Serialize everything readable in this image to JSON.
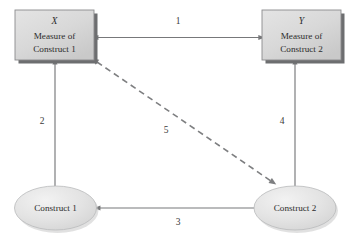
{
  "figure": {
    "type": "nomological-network-diagram",
    "background_color": "#ffffff"
  },
  "nodes": {
    "measure_x": {
      "shape": "rectangle",
      "variable": "X",
      "line1": "Measure of",
      "line2": "Construct 1",
      "fill_color": "#d9d9d9"
    },
    "measure_y": {
      "shape": "rectangle",
      "variable": "Y",
      "line1": "Measure of",
      "line2": "Construct 2",
      "fill_color": "#d9d9d9"
    },
    "construct_1": {
      "shape": "ellipse",
      "label": "Construct 1",
      "fill_color": "#e2e2e2"
    },
    "construct_2": {
      "shape": "ellipse",
      "label": "Construct 2",
      "fill_color": "#e2e2e2"
    }
  },
  "edges": {
    "edge_1": {
      "label": "1",
      "from": "measure_x",
      "to": "measure_y",
      "style": "solid",
      "arrowheads": "both"
    },
    "edge_2": {
      "label": "2",
      "from": "measure_x",
      "to": "construct_1",
      "style": "solid",
      "arrowheads": "both"
    },
    "edge_3": {
      "label": "3",
      "from": "construct_1",
      "to": "construct_2",
      "style": "solid",
      "arrowheads": "both"
    },
    "edge_4": {
      "label": "4",
      "from": "measure_y",
      "to": "construct_2",
      "style": "solid",
      "arrowheads": "both"
    },
    "edge_5": {
      "label": "5",
      "from": "measure_x",
      "to": "construct_2",
      "style": "dashed",
      "arrowheads": "both"
    }
  },
  "colors": {
    "line": "#77787a",
    "dashed_line": "#7e7f81",
    "text": "#2c2c2c",
    "box_fill": "#d9d9d9",
    "box_shadow": "#6d6e70",
    "ellipse_fill": "#e2e2e2"
  }
}
